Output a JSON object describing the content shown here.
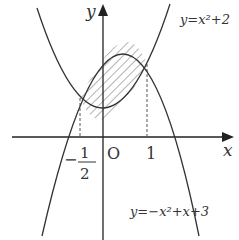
{
  "diagram": {
    "x_axis_label": "x",
    "y_axis_label": "y",
    "origin_label": "O",
    "tick_labels": {
      "one": "1",
      "neg_half_num": "1",
      "neg_half_den": "2",
      "neg_sign": "−"
    },
    "curve1_label": "y=x²+2",
    "curve2_label": "y=−x²+x+3",
    "intersections": [
      {
        "x": -0.5,
        "y": 2.25
      },
      {
        "x": 1,
        "y": 3
      }
    ],
    "shaded_region": "between curves for −1/2 ≤ x ≤ 1"
  }
}
